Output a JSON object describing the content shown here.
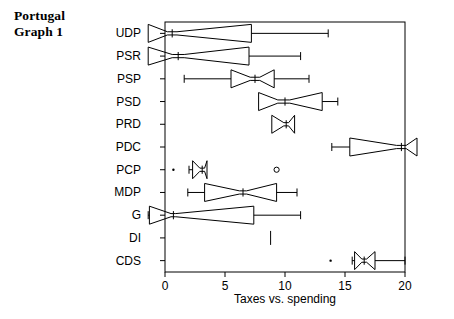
{
  "title": {
    "line1": "Portugal",
    "line2": "Graph 1"
  },
  "axis": {
    "x_label": "Taxes vs. spending",
    "x_ticks": [
      0,
      5,
      10,
      15,
      20
    ],
    "x_min": 0,
    "x_max": 20
  },
  "chart_data": {
    "type": "box",
    "orientation": "horizontal",
    "title": "Portugal Graph 1",
    "xlabel": "Taxes vs. spending",
    "ylabel": "",
    "xlim": [
      0,
      20
    ],
    "grid": false,
    "legend": "none",
    "notched": true,
    "categories": [
      "UDP",
      "PSR",
      "PSP",
      "PSD",
      "PRD",
      "PDC",
      "PCP",
      "MDP",
      "G",
      "DI",
      "CDS"
    ],
    "boxes": [
      {
        "category": "UDP",
        "whisker_low": -1.4,
        "q1": -1.4,
        "notch_low": 0.2,
        "median": 0.6,
        "notch_high": 1.0,
        "q3": 7.2,
        "whisker_high": 13.6,
        "outliers": []
      },
      {
        "category": "PSR",
        "whisker_low": -1.4,
        "q1": -1.4,
        "notch_low": 0.6,
        "median": 1.1,
        "notch_high": 1.6,
        "q3": 7.0,
        "whisker_high": 11.3,
        "outliers": []
      },
      {
        "category": "PSP",
        "whisker_low": 1.6,
        "q1": 5.5,
        "notch_low": 7.1,
        "median": 7.5,
        "notch_high": 7.9,
        "q3": 9.1,
        "whisker_high": 12.0,
        "outliers": []
      },
      {
        "category": "PSD",
        "whisker_low": 7.8,
        "q1": 7.8,
        "notch_low": 9.4,
        "median": 10.0,
        "notch_high": 10.4,
        "q3": 13.1,
        "whisker_high": 14.4,
        "outliers": []
      },
      {
        "category": "PRD",
        "whisker_low": 8.9,
        "q1": 8.9,
        "notch_low": 9.9,
        "median": 10.1,
        "notch_high": 10.3,
        "q3": 10.8,
        "whisker_high": 10.8,
        "outliers": []
      },
      {
        "category": "PDC",
        "whisker_low": 13.9,
        "q1": 15.4,
        "notch_low": 19.3,
        "median": 19.7,
        "notch_high": 20.1,
        "q3": 21.0,
        "whisker_high": 21.0,
        "outliers": []
      },
      {
        "category": "PCP",
        "whisker_low": 2.0,
        "q1": 2.3,
        "notch_low": 2.9,
        "median": 3.1,
        "notch_high": 3.3,
        "q3": 3.5,
        "whisker_high": 3.5,
        "outliers": [
          0.7,
          9.3
        ]
      },
      {
        "category": "MDP",
        "whisker_low": 1.9,
        "q1": 3.3,
        "notch_low": 6.2,
        "median": 6.5,
        "notch_high": 6.8,
        "q3": 9.3,
        "whisker_high": 11.0,
        "outliers": []
      },
      {
        "category": "G",
        "whisker_low": -1.4,
        "q1": -1.3,
        "notch_low": 0.5,
        "median": 0.7,
        "notch_high": 0.9,
        "q3": 7.4,
        "whisker_high": 11.3,
        "outliers": []
      },
      {
        "category": "DI",
        "whisker_low": 8.8,
        "q1": 8.8,
        "notch_low": 8.8,
        "median": 8.8,
        "notch_high": 8.8,
        "q3": 8.8,
        "whisker_high": 8.8,
        "outliers": []
      },
      {
        "category": "CDS",
        "whisker_low": 15.6,
        "q1": 15.8,
        "notch_low": 16.4,
        "median": 16.6,
        "notch_high": 16.8,
        "q3": 17.5,
        "whisker_high": 20.0,
        "outliers": [
          13.8
        ]
      }
    ]
  }
}
